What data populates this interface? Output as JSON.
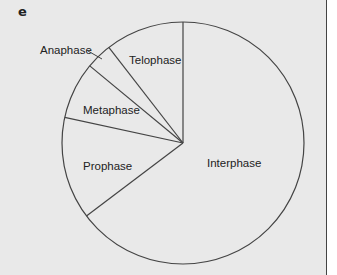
{
  "panel": {
    "letter": "e",
    "background": "#e9e9e9",
    "stroke": "#444444"
  },
  "chart_data": {
    "type": "pie",
    "title": "",
    "start_angle_deg": 0,
    "direction": "counterclockwise-from-top",
    "categories": [
      "Telophase",
      "Anaphase",
      "Metaphase",
      "Prophase",
      "Interphase"
    ],
    "values": [
      10.5,
      3.5,
      7.6,
      13.7,
      64.7
    ],
    "unit": "% of cell cycle (estimated from slice angles)",
    "center": [
      183,
      143
    ],
    "radius": 121,
    "labels": [
      {
        "text": "Telophase",
        "x": 129,
        "y": 64,
        "leader": null
      },
      {
        "text": "Anaphase",
        "x": 40,
        "y": 54,
        "leader": [
          88,
          51,
          102,
          59
        ]
      },
      {
        "text": "Metaphase",
        "x": 83,
        "y": 114,
        "leader": null
      },
      {
        "text": "Prophase",
        "x": 83,
        "y": 170,
        "leader": null
      },
      {
        "text": "Interphase",
        "x": 207,
        "y": 167,
        "leader": null
      }
    ],
    "legend": null,
    "grid": false
  }
}
